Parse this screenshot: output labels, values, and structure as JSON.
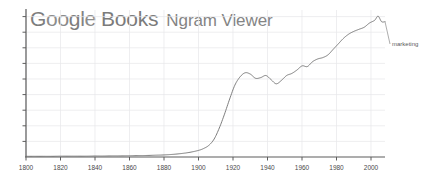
{
  "app": {
    "brand_word": "Google",
    "brand_letters": [
      "G",
      "o",
      "o",
      "g",
      "l",
      "e"
    ],
    "secondary_word": "Books",
    "product_name": "Ngram Viewer"
  },
  "colors": {
    "brand_text": "#7d7d7d",
    "books_text": "#7b7b7b",
    "product_text": "#848484",
    "axis": "#666666",
    "grid": "#e4e4e8",
    "series_line": "#6f6f6f",
    "tick_label": "#4a4a4a",
    "background": "#ffffff"
  },
  "chart_data": {
    "type": "line",
    "title": "",
    "xlabel": "",
    "ylabel": "",
    "xlim": [
      1800,
      2008
    ],
    "ylim": [
      0,
      0.0105
    ],
    "grid": true,
    "legend_position": "right-inline",
    "xticks": [
      1800,
      1820,
      1840,
      1860,
      1880,
      1900,
      1920,
      1940,
      1960,
      1980,
      2000
    ],
    "xtick_labels": [
      "1800",
      "1820",
      "1840",
      "1860",
      "1880",
      "1900",
      "1920",
      "1940",
      "1960",
      "1980",
      "2000"
    ],
    "yticks": [
      0,
      0.0013,
      0.0026,
      0.0039,
      0.0052,
      0.0065,
      0.0078,
      0.0091,
      0.0104
    ],
    "ytick_labels": [
      "",
      "",
      "",
      "",
      "",
      "",
      "",
      "",
      ""
    ],
    "series": [
      {
        "name": "marketing",
        "label": "marketing",
        "x": [
          1800,
          1805,
          1810,
          1815,
          1820,
          1825,
          1830,
          1835,
          1840,
          1845,
          1850,
          1855,
          1860,
          1865,
          1870,
          1875,
          1880,
          1885,
          1890,
          1895,
          1900,
          1903,
          1906,
          1909,
          1912,
          1915,
          1918,
          1921,
          1924,
          1927,
          1930,
          1933,
          1936,
          1939,
          1942,
          1945,
          1948,
          1951,
          1954,
          1957,
          1960,
          1963,
          1966,
          1969,
          1972,
          1975,
          1978,
          1981,
          1984,
          1987,
          1990,
          1993,
          1996,
          1999,
          2002,
          2004,
          2006,
          2008
        ],
        "values": [
          5e-05,
          5e-05,
          5e-05,
          5e-05,
          6e-05,
          6e-05,
          6e-05,
          6e-05,
          7e-05,
          7e-05,
          8e-05,
          8e-05,
          9e-05,
          0.0001,
          0.00011,
          0.00013,
          0.00015,
          0.00019,
          0.00025,
          0.00034,
          0.00048,
          0.00062,
          0.00085,
          0.0013,
          0.0021,
          0.0031,
          0.0042,
          0.0052,
          0.0058,
          0.0061,
          0.006,
          0.0057,
          0.00575,
          0.0059,
          0.0056,
          0.0053,
          0.00555,
          0.0059,
          0.00605,
          0.0063,
          0.0066,
          0.00655,
          0.0069,
          0.0071,
          0.0072,
          0.0074,
          0.0078,
          0.0082,
          0.0086,
          0.0089,
          0.0091,
          0.00925,
          0.0094,
          0.0097,
          0.0099,
          0.0102,
          0.0098,
          0.0098
        ]
      }
    ]
  }
}
